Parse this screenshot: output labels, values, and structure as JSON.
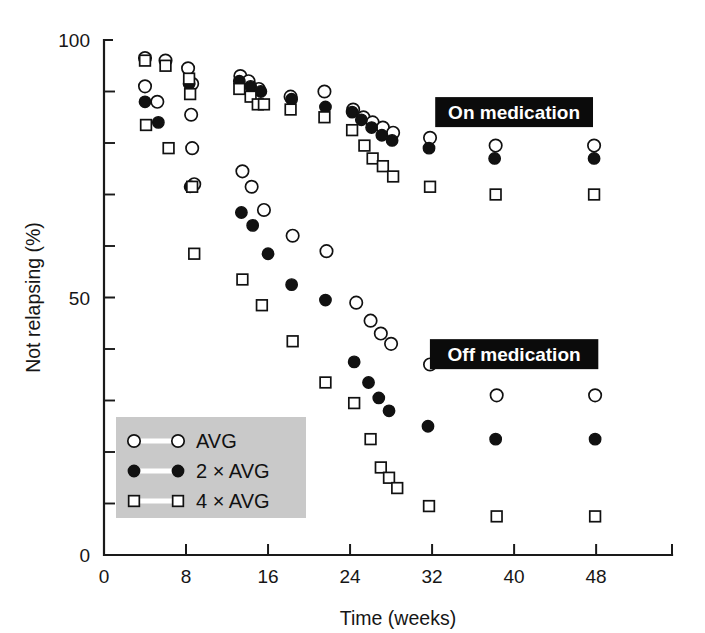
{
  "chart_data": {
    "type": "scatter",
    "title": "",
    "xlabel": "Time (weeks)",
    "ylabel": "Not relapsing (%)",
    "xlim": [
      0,
      55.4
    ],
    "ylim": [
      0,
      100
    ],
    "xticks": [
      0,
      8,
      16,
      24,
      32,
      40,
      48
    ],
    "xtick_labels": [
      "0",
      "8",
      "16",
      "24",
      "32",
      "40",
      "48"
    ],
    "yticks": [
      0,
      50,
      100
    ],
    "ytick_labels": [
      "0",
      "50",
      "100"
    ],
    "y_minor_ticks": [
      10,
      20,
      30,
      40,
      60,
      70,
      80,
      90
    ],
    "grid": false,
    "legend_position": "lower left",
    "series": [
      {
        "name": "AVG",
        "marker": "open-circle",
        "points": [
          {
            "x": 4.0,
            "y": 96.5
          },
          {
            "x": 4.0,
            "y": 91.0
          },
          {
            "x": 5.2,
            "y": 88.0
          },
          {
            "x": 6.0,
            "y": 96.0
          },
          {
            "x": 8.2,
            "y": 94.5
          },
          {
            "x": 8.6,
            "y": 91.5
          },
          {
            "x": 8.5,
            "y": 85.5
          },
          {
            "x": 8.6,
            "y": 79.0
          },
          {
            "x": 8.8,
            "y": 72.0
          },
          {
            "x": 13.3,
            "y": 93.0
          },
          {
            "x": 14.1,
            "y": 92.0
          },
          {
            "x": 15.1,
            "y": 90.5
          },
          {
            "x": 13.5,
            "y": 74.5
          },
          {
            "x": 14.4,
            "y": 71.5
          },
          {
            "x": 15.6,
            "y": 67.0
          },
          {
            "x": 18.2,
            "y": 89.0
          },
          {
            "x": 18.4,
            "y": 62.0
          },
          {
            "x": 21.5,
            "y": 90.0
          },
          {
            "x": 21.7,
            "y": 59.0
          },
          {
            "x": 24.3,
            "y": 86.5
          },
          {
            "x": 25.3,
            "y": 85.0
          },
          {
            "x": 24.6,
            "y": 49.0
          },
          {
            "x": 26.2,
            "y": 84.0
          },
          {
            "x": 27.2,
            "y": 83.0
          },
          {
            "x": 28.2,
            "y": 82.0
          },
          {
            "x": 26.0,
            "y": 45.5
          },
          {
            "x": 27.0,
            "y": 43.0
          },
          {
            "x": 28.0,
            "y": 41.0
          },
          {
            "x": 31.8,
            "y": 81.0
          },
          {
            "x": 31.8,
            "y": 37.0
          },
          {
            "x": 38.2,
            "y": 79.5
          },
          {
            "x": 38.3,
            "y": 31.0
          },
          {
            "x": 47.8,
            "y": 79.5
          },
          {
            "x": 47.9,
            "y": 31.0
          }
        ]
      },
      {
        "name": "2 × AVG",
        "marker": "filled-circle",
        "points": [
          {
            "x": 4.0,
            "y": 88.0
          },
          {
            "x": 5.3,
            "y": 84.0
          },
          {
            "x": 8.3,
            "y": 91.5
          },
          {
            "x": 8.4,
            "y": 71.5
          },
          {
            "x": 13.2,
            "y": 92.0
          },
          {
            "x": 14.3,
            "y": 91.0
          },
          {
            "x": 15.3,
            "y": 90.0
          },
          {
            "x": 13.4,
            "y": 66.5
          },
          {
            "x": 14.5,
            "y": 64.0
          },
          {
            "x": 16.0,
            "y": 58.5
          },
          {
            "x": 18.3,
            "y": 88.5
          },
          {
            "x": 18.3,
            "y": 52.5
          },
          {
            "x": 21.6,
            "y": 87.0
          },
          {
            "x": 21.6,
            "y": 49.5
          },
          {
            "x": 24.2,
            "y": 86.0
          },
          {
            "x": 25.1,
            "y": 84.5
          },
          {
            "x": 24.4,
            "y": 37.5
          },
          {
            "x": 26.1,
            "y": 83.0
          },
          {
            "x": 27.1,
            "y": 81.5
          },
          {
            "x": 28.1,
            "y": 80.5
          },
          {
            "x": 25.8,
            "y": 33.5
          },
          {
            "x": 26.8,
            "y": 30.5
          },
          {
            "x": 27.8,
            "y": 28.0
          },
          {
            "x": 31.7,
            "y": 79.0
          },
          {
            "x": 31.6,
            "y": 25.0
          },
          {
            "x": 38.1,
            "y": 77.0
          },
          {
            "x": 38.2,
            "y": 22.5
          },
          {
            "x": 47.8,
            "y": 77.0
          },
          {
            "x": 47.9,
            "y": 22.5
          }
        ]
      },
      {
        "name": "4 × AVG",
        "marker": "open-square",
        "points": [
          {
            "x": 4.0,
            "y": 96.0
          },
          {
            "x": 4.1,
            "y": 83.5
          },
          {
            "x": 6.0,
            "y": 95.0
          },
          {
            "x": 6.3,
            "y": 79.0
          },
          {
            "x": 8.3,
            "y": 92.5
          },
          {
            "x": 8.4,
            "y": 89.5
          },
          {
            "x": 8.6,
            "y": 71.5
          },
          {
            "x": 8.8,
            "y": 58.5
          },
          {
            "x": 13.2,
            "y": 90.5
          },
          {
            "x": 14.3,
            "y": 89.0
          },
          {
            "x": 15.0,
            "y": 87.5
          },
          {
            "x": 15.6,
            "y": 87.5
          },
          {
            "x": 13.5,
            "y": 53.5
          },
          {
            "x": 15.4,
            "y": 48.5
          },
          {
            "x": 18.2,
            "y": 86.5
          },
          {
            "x": 18.4,
            "y": 41.5
          },
          {
            "x": 21.5,
            "y": 85.0
          },
          {
            "x": 21.6,
            "y": 33.5
          },
          {
            "x": 24.2,
            "y": 82.5
          },
          {
            "x": 25.4,
            "y": 79.5
          },
          {
            "x": 24.4,
            "y": 29.5
          },
          {
            "x": 26.2,
            "y": 77.0
          },
          {
            "x": 27.2,
            "y": 75.5
          },
          {
            "x": 28.2,
            "y": 73.5
          },
          {
            "x": 26.0,
            "y": 22.5
          },
          {
            "x": 27.0,
            "y": 17.0
          },
          {
            "x": 27.8,
            "y": 15.0
          },
          {
            "x": 28.6,
            "y": 13.0
          },
          {
            "x": 31.8,
            "y": 71.5
          },
          {
            "x": 31.7,
            "y": 9.5
          },
          {
            "x": 38.2,
            "y": 70.0
          },
          {
            "x": 38.3,
            "y": 7.5
          },
          {
            "x": 47.8,
            "y": 70.0
          },
          {
            "x": 47.9,
            "y": 7.5
          }
        ]
      }
    ],
    "annotations": [
      {
        "text": "On medication",
        "x": 40.0,
        "y": 86.0,
        "style": "black-box"
      },
      {
        "text": "Off medication",
        "x": 40.0,
        "y": 39.0,
        "style": "black-box"
      }
    ]
  },
  "legend": {
    "entries": [
      {
        "label": "AVG",
        "marker": "open-circle"
      },
      {
        "label": "2 × AVG",
        "marker": "filled-circle"
      },
      {
        "label": "4 × AVG",
        "marker": "open-square"
      }
    ],
    "background_color": "#c9c9c9"
  },
  "colors": {
    "marker_stroke": "#111111",
    "marker_fill": "#111111",
    "axis": "#1a1a1a",
    "legend_background": "#c9c9c9",
    "callout_background": "#0b0b0b",
    "callout_text": "#ffffff",
    "page_background": "#ffffff"
  }
}
